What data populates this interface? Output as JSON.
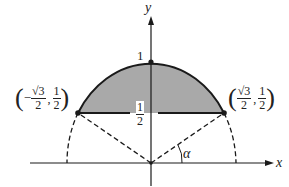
{
  "diagram": {
    "title": "",
    "axes": {
      "x_label": "x",
      "y_label": "y"
    },
    "labels": {
      "top": "1",
      "chord_height_num": "1",
      "chord_height_den": "2",
      "angle": "α"
    },
    "points": {
      "left": {
        "x_sign": "−",
        "x_num": "√3",
        "x_den": "2",
        "y_num": "1",
        "y_den": "2",
        "comma": ","
      },
      "right": {
        "x_sign": "",
        "x_num": "√3",
        "x_den": "2",
        "y_num": "1",
        "y_den": "2",
        "comma": ","
      }
    },
    "colors": {
      "fill": "#a9a9a9",
      "stroke": "#1a1a1a",
      "background": "#ffffff"
    }
  }
}
